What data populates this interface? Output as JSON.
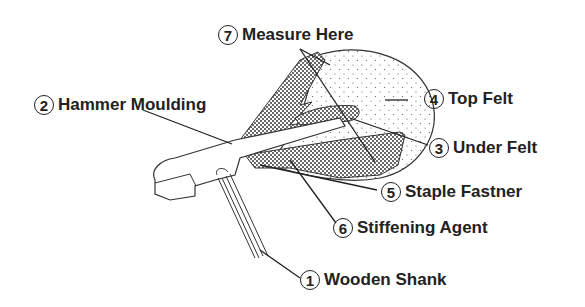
{
  "diagram": {
    "labels": [
      {
        "id": "wooden-shank",
        "number": "1",
        "text": "Wooden Shank"
      },
      {
        "id": "hammer-moulding",
        "number": "2",
        "text": "Hammer Moulding"
      },
      {
        "id": "under-felt",
        "number": "3",
        "text": "Under Felt"
      },
      {
        "id": "top-felt",
        "number": "4",
        "text": "Top Felt"
      },
      {
        "id": "staple-fastner",
        "number": "5",
        "text": "Staple Fastner"
      },
      {
        "id": "stiffening-agent",
        "number": "6",
        "text": "Stiffening Agent"
      },
      {
        "id": "measure-here",
        "number": "7",
        "text": "Measure Here"
      }
    ]
  }
}
